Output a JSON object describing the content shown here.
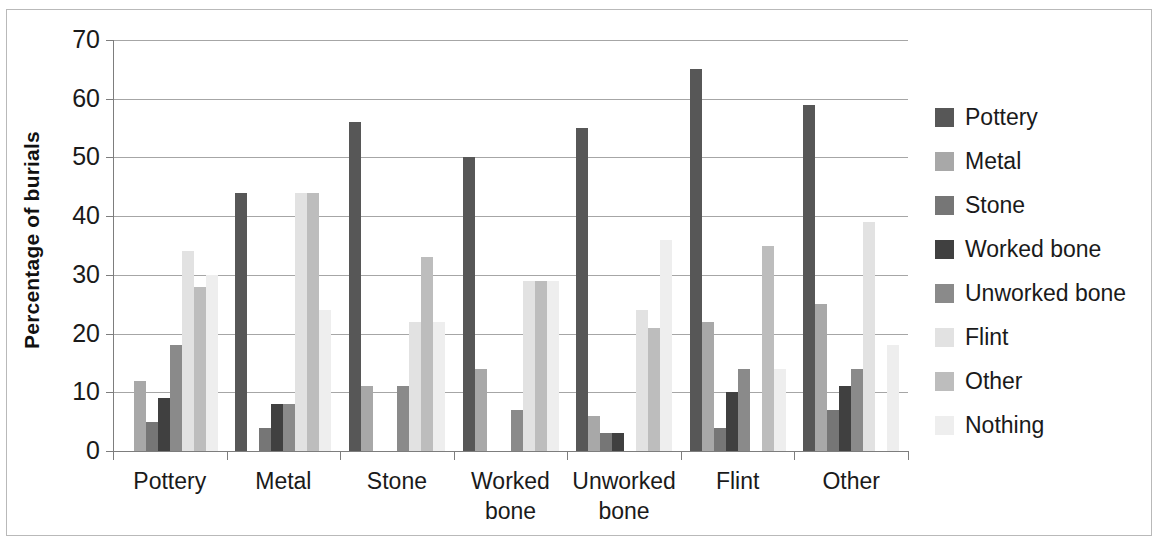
{
  "chart_data": {
    "type": "bar",
    "title": "",
    "xlabel": "",
    "ylabel": "Percentage of burials",
    "ylim": [
      0,
      70
    ],
    "ytick_step": 10,
    "yticks": [
      0,
      10,
      20,
      30,
      40,
      50,
      60,
      70
    ],
    "grid": true,
    "legend_position": "right",
    "categories": [
      "Pottery",
      "Metal",
      "Stone",
      "Worked bone",
      "Unworked bone",
      "Flint",
      "Other"
    ],
    "category_labels_wrapped": [
      [
        "Pottery"
      ],
      [
        "Metal"
      ],
      [
        "Stone"
      ],
      [
        "Worked",
        "bone"
      ],
      [
        "Unworked",
        "bone"
      ],
      [
        "Flint"
      ],
      [
        "Other"
      ]
    ],
    "series": [
      {
        "name": "Pottery",
        "color": "#575757",
        "values": [
          0,
          44,
          56,
          50,
          55,
          65,
          59
        ]
      },
      {
        "name": "Metal",
        "color": "#a8a8a8",
        "values": [
          12,
          0,
          11,
          14,
          6,
          22,
          25
        ]
      },
      {
        "name": "Stone",
        "color": "#767676",
        "values": [
          5,
          4,
          0,
          0,
          3,
          4,
          7
        ]
      },
      {
        "name": "Worked bone",
        "color": "#404040",
        "values": [
          9,
          8,
          0,
          0,
          3,
          10,
          11
        ]
      },
      {
        "name": "Unworked bone",
        "color": "#8a8a8a",
        "values": [
          18,
          8,
          11,
          7,
          0,
          14,
          14
        ]
      },
      {
        "name": "Flint",
        "color": "#e2e2e2",
        "values": [
          34,
          44,
          22,
          29,
          24,
          0,
          39
        ]
      },
      {
        "name": "Other",
        "color": "#bdbdbd",
        "values": [
          28,
          44,
          33,
          29,
          21,
          35,
          0
        ]
      },
      {
        "name": "Nothing",
        "color": "#eeeeee",
        "values": [
          30,
          24,
          22,
          29,
          36,
          14,
          18
        ]
      }
    ]
  },
  "legend": {
    "items": [
      {
        "label": "Pottery"
      },
      {
        "label": "Metal"
      },
      {
        "label": "Stone"
      },
      {
        "label": "Worked bone"
      },
      {
        "label": "Unworked bone"
      },
      {
        "label": "Flint"
      },
      {
        "label": "Other"
      },
      {
        "label": "Nothing"
      }
    ]
  }
}
